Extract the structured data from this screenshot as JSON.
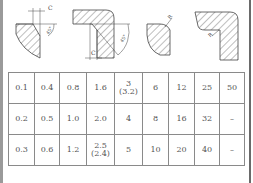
{
  "figures": [
    {
      "name": "chamfer-shaft",
      "labels": {
        "dim": "C",
        "angle": "45°"
      }
    },
    {
      "name": "chamfer-bore",
      "labels": {
        "dim": "C",
        "angle": "45°"
      }
    },
    {
      "name": "round-shaft",
      "labels": {
        "dim": "R"
      }
    },
    {
      "name": "round-inner-corner",
      "labels": {
        "dim": "R"
      }
    }
  ],
  "table": {
    "rows": [
      [
        "0.1",
        "0.4",
        "0.8",
        "1.6",
        [
          "3",
          "(3.2)"
        ],
        "6",
        "12",
        "25",
        "50"
      ],
      [
        "0.2",
        "0.5",
        "1.0",
        "2.0",
        "4",
        "8",
        "16",
        "32",
        "–"
      ],
      [
        "0.3",
        "0.6",
        "1.2",
        [
          "2.5",
          "(2.4)"
        ],
        "5",
        "10",
        "20",
        "40",
        "–"
      ]
    ]
  }
}
